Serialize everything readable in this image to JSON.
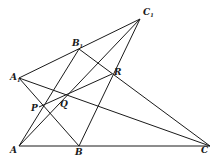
{
  "diagram": {
    "points": {
      "A": {
        "label": "A",
        "sub": "",
        "x": 19,
        "y": 146,
        "lx": 10,
        "ly": 153
      },
      "B": {
        "label": "B",
        "sub": "",
        "x": 79,
        "y": 146,
        "lx": 75,
        "ly": 155
      },
      "C": {
        "label": "C",
        "sub": "",
        "x": 210,
        "y": 146,
        "lx": 201,
        "ly": 153
      },
      "A1": {
        "label": "A",
        "sub": "1",
        "x": 19,
        "y": 78,
        "lx": 10,
        "ly": 78
      },
      "B1": {
        "label": "B",
        "sub": "1",
        "x": 79,
        "y": 49,
        "lx": 73,
        "ly": 46
      },
      "C1": {
        "label": "C",
        "sub": "1",
        "x": 140,
        "y": 19,
        "lx": 143,
        "ly": 15
      },
      "P": {
        "label": "P",
        "sub": "",
        "x": 39,
        "y": 107,
        "lx": 31,
        "ly": 110
      },
      "Q": {
        "label": "Q",
        "sub": "",
        "x": 64,
        "y": 97,
        "lx": 60,
        "ly": 107
      },
      "R": {
        "label": "R",
        "sub": "",
        "x": 112,
        "y": 74,
        "lx": 114,
        "ly": 74
      }
    },
    "segments": [
      [
        "A1",
        "C1"
      ],
      [
        "A",
        "C"
      ],
      [
        "A1",
        "C"
      ],
      [
        "B1",
        "C"
      ],
      [
        "C1",
        "A"
      ],
      [
        "C1",
        "B"
      ],
      [
        "A",
        "B1"
      ],
      [
        "A1",
        "B"
      ],
      [
        "P",
        "R"
      ]
    ],
    "stroke_color": "#1a1a1a"
  }
}
